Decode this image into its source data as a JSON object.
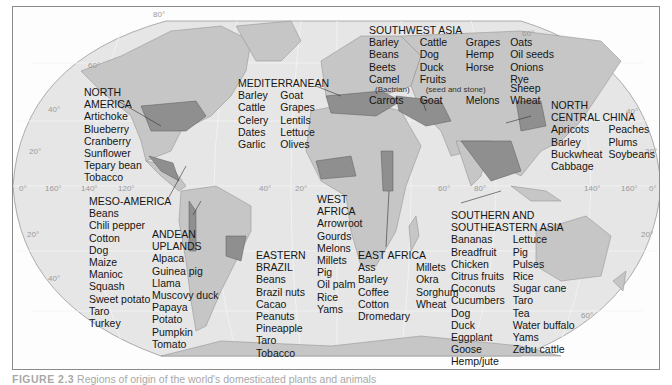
{
  "map": {
    "title": "Regions of origin of domesticated plants and animals",
    "colors": {
      "ocean": "#e6e6e6",
      "land": "#c6c6c6",
      "origin_region": "#8f8f8f",
      "frame": "#8a8a8a",
      "text": "#151515"
    },
    "graticule_labels": {
      "lat_left": [
        "80°",
        "60°",
        "40°",
        "20°",
        "0°",
        "20°",
        "40°"
      ],
      "lon_top_row": [
        "160°",
        "140°",
        "120°",
        "40°",
        "20°",
        "60°",
        "80°",
        "140°",
        "160°"
      ],
      "lat_right": [
        "60°",
        "40°",
        "20°",
        "0°",
        "20°",
        "60°"
      ]
    },
    "regions": [
      {
        "name": "NORTH AMERICA",
        "heading": [
          "NORTH",
          "AMERICA"
        ],
        "columns": [
          [
            "Artichoke",
            "Blueberry",
            "Cranberry",
            "Sunflower",
            "Tepary bean",
            "Tobacco"
          ]
        ]
      },
      {
        "name": "MESO-AMERICA",
        "heading": [
          "MESO-AMERICA"
        ],
        "columns": [
          [
            "Beans",
            "Chili pepper",
            "Cotton",
            "Dog",
            "Maize",
            "Manioc",
            "Squash",
            "Sweet potato",
            "Taro",
            "Turkey"
          ]
        ]
      },
      {
        "name": "ANDEAN UPLANDS",
        "heading": [
          "ANDEAN",
          "UPLANDS"
        ],
        "columns": [
          [
            "Alpaca",
            "Guinea pig",
            "Llama",
            "Muscovy duck",
            "Papaya",
            "Potato",
            "Pumpkin",
            "Tomato"
          ]
        ]
      },
      {
        "name": "EASTERN BRAZIL",
        "heading": [
          "EASTERN",
          "BRAZIL"
        ],
        "columns": [
          [
            "Beans",
            "Brazil nuts",
            "Cacao",
            "Peanuts",
            "Pineapple",
            "Taro",
            "Tobacco"
          ]
        ]
      },
      {
        "name": "MEDITERRANEAN",
        "heading": [
          "MEDITERRANEAN"
        ],
        "columns": [
          [
            "Barley",
            "Cattle",
            "Celery",
            "Dates",
            "Garlic"
          ],
          [
            "Goat",
            "Grapes",
            "Lentils",
            "Lettuce",
            "Olives"
          ]
        ]
      },
      {
        "name": "SOUTHWEST ASIA",
        "heading": [
          "SOUTHWEST ASIA"
        ],
        "columns": [
          [
            "Barley",
            "Beans",
            "Beets",
            "Camel",
            "(Bactrian)",
            "Carrots"
          ],
          [
            "Cattle",
            "Dog",
            "Duck",
            "Fruits",
            "(seed and stone)",
            "Goat"
          ],
          [
            "Grapes",
            "Hemp",
            "Horse",
            "",
            "",
            "Melons"
          ],
          [
            "Oats",
            "Oil seeds",
            "Onions",
            "Rye",
            "Sheep",
            "Wheat"
          ]
        ]
      },
      {
        "name": "WEST AFRICA",
        "heading": [
          "WEST",
          "AFRICA"
        ],
        "columns": [
          [
            "Arrowroot",
            "Gourds",
            "Melons",
            "Millets",
            "Pig",
            "Oil palm",
            "Rice",
            "Yams"
          ]
        ]
      },
      {
        "name": "EAST AFRICA",
        "heading": [
          "EAST AFRICA"
        ],
        "columns": [
          [
            "Ass",
            "Barley",
            "Coffee",
            "Cotton",
            "Dromedary"
          ],
          [
            "Millets",
            "Okra",
            "Sorghum",
            "Wheat"
          ]
        ]
      },
      {
        "name": "NORTH CENTRAL CHINA",
        "heading": [
          "NORTH",
          "CENTRAL CHINA"
        ],
        "columns": [
          [
            "Apricots",
            "Barley",
            "Buckwheat",
            "Cabbage"
          ],
          [
            "Peaches",
            "Plums",
            "Soybeans"
          ]
        ]
      },
      {
        "name": "SOUTHERN AND SOUTHEASTERN ASIA",
        "heading": [
          "SOUTHERN AND",
          "SOUTHEASTERN ASIA"
        ],
        "columns": [
          [
            "Bananas",
            "Breadfruit",
            "Chicken",
            "Citrus fruits",
            "Coconuts",
            "Cucumbers",
            "Dog",
            "Duck",
            "Eggplant",
            "Goose",
            "Hemp/jute"
          ],
          [
            "Lettuce",
            "Pig",
            "Pulses",
            "Rice",
            "Sugar cane",
            "Taro",
            "Tea",
            "Water buffalo",
            "Yams",
            "Zebu cattle"
          ]
        ]
      }
    ]
  },
  "caption": {
    "figure_label": "FIGURE 2.3",
    "text": "Regions of origin of the world's domesticated plants and animals"
  }
}
